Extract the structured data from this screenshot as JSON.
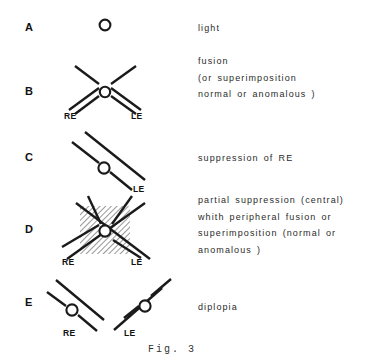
{
  "figure": {
    "caption": "Fig. 3",
    "background_color": "#ffffff",
    "ink_color": "#1a1a1a"
  },
  "panels": [
    {
      "letter": "A",
      "description_lines": [
        "light"
      ],
      "eye_labels": [],
      "diagram": "single-circle"
    },
    {
      "letter": "B",
      "description_lines": [
        "fusion",
        "(or  superimposition",
        "normal or anomalous )"
      ],
      "eye_labels": [
        "RE",
        "LE"
      ],
      "diagram": "crossed-double-lines-with-ring"
    },
    {
      "letter": "C",
      "description_lines": [
        "suppression   of RE"
      ],
      "eye_labels": [
        "LE"
      ],
      "diagram": "single-double-line-with-ring"
    },
    {
      "letter": "D",
      "description_lines": [
        "partial  suppression (central)",
        "whith  peripheral  fusion   or",
        "superimposition (normal  or",
        "anomalous )"
      ],
      "eye_labels": [
        "RE",
        "LE"
      ],
      "diagram": "crossed-double-lines-hatched-center-with-ring"
    },
    {
      "letter": "E",
      "description_lines": [
        "diplopia"
      ],
      "eye_labels": [
        "RE",
        "LE"
      ],
      "diagram": "two-separate-double-lines-with-rings"
    }
  ]
}
